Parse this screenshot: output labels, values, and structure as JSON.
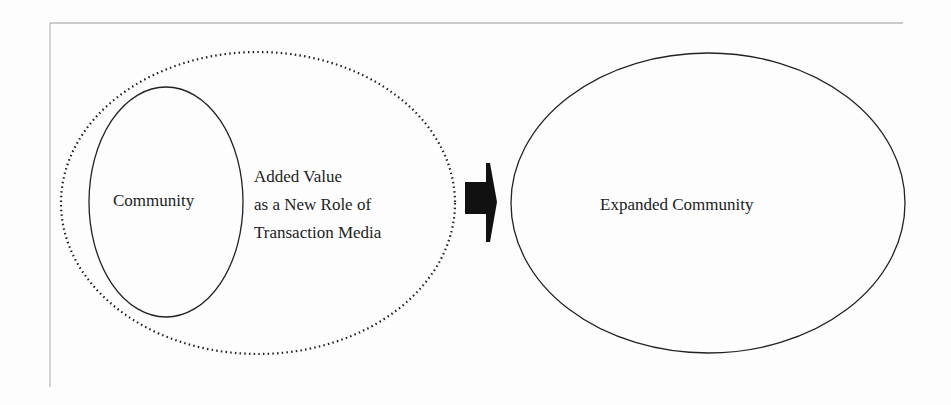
{
  "diagram": {
    "community_label": "Community",
    "added_value_lines": [
      "Added Value",
      "as a New Role of",
      "Transaction Media"
    ],
    "expanded_label": "Expanded Community",
    "arrow": "right-arrow",
    "colors": {
      "line": "#222222",
      "background": "#fdfdfd",
      "frame": "#999999"
    }
  }
}
